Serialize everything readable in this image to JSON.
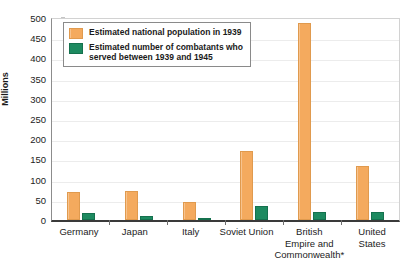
{
  "chart_data": {
    "type": "bar",
    "title": "",
    "xlabel": "",
    "ylabel": "Millions",
    "ylim": [
      0,
      500
    ],
    "ytick_step": 50,
    "yticks": [
      0,
      50,
      100,
      150,
      200,
      250,
      300,
      350,
      400,
      450,
      500
    ],
    "grid": true,
    "legend_position": "top-left",
    "categories": [
      "Germany",
      "Japan",
      "Italy",
      "Soviet Union",
      "British\nEmpire and\nCommonwealth*",
      "United States"
    ],
    "series": [
      {
        "name": "Estimated national population in 1939",
        "color": "#f4aa5e",
        "values": [
          70,
          72,
          45,
          170,
          487,
          133
        ]
      },
      {
        "name": "Estimated number of combatants who\nserved between 1939 and 1945",
        "color": "#1d8a60",
        "values": [
          18,
          9,
          4,
          35,
          20,
          21
        ]
      }
    ]
  },
  "axis": {
    "y_title": "Millions"
  },
  "colors": {
    "population": "#f4aa5e",
    "combatants": "#1d8a60",
    "axis_line": "#3a3a3a",
    "gridline": "#ececec",
    "legend_border": "#8a8a8a"
  }
}
